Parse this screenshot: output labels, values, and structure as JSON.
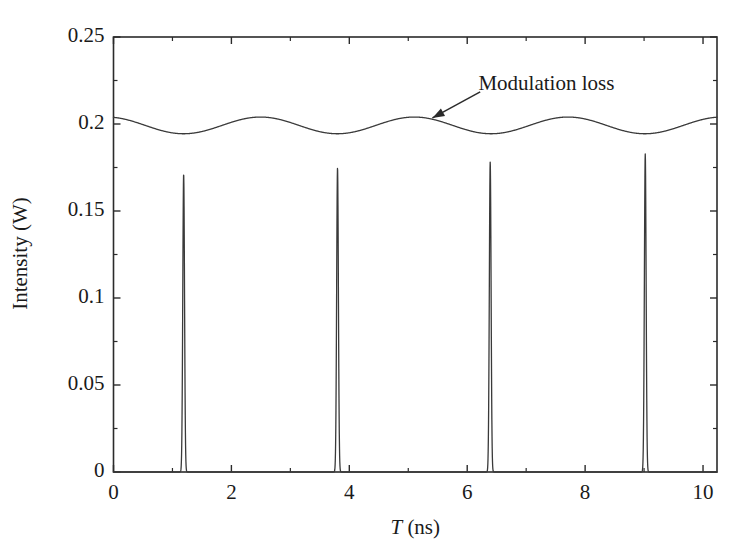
{
  "chart_data": {
    "type": "line",
    "title": "",
    "xlabel": "T (ns)",
    "xlabel_italic_part": "T",
    "xlabel_rest": " (ns)",
    "ylabel": "Intensity (W)",
    "xlim": [
      0,
      10.237
    ],
    "ylim": [
      0,
      0.25
    ],
    "grid": false,
    "legend": "none",
    "xticks": [
      0,
      2,
      4,
      6,
      8,
      10
    ],
    "xtick_labels": [
      "0",
      "2",
      "4",
      "6",
      "8",
      "10"
    ],
    "xminor_ticks": [
      1,
      3,
      5,
      7,
      9
    ],
    "yticks": [
      0,
      0.05,
      0.1,
      0.15,
      0.2,
      0.25
    ],
    "ytick_labels": [
      "0",
      "0.05",
      "0.1",
      "0.15",
      "0.2",
      "0.25"
    ],
    "yminor_ticks": [
      0.025,
      0.075,
      0.125,
      0.175,
      0.225
    ],
    "annotations": [
      {
        "text": "Modulation loss",
        "text_x": 6.19,
        "text_y": 0.2215,
        "arrow_from_x": 6.22,
        "arrow_from_y": 0.2185,
        "arrow_to_x": 5.41,
        "arrow_to_y": 0.2035
      }
    ],
    "series": [
      {
        "name": "Modulation loss",
        "kind": "sinusoid",
        "color": "#3a3a3a",
        "mean": 0.1992,
        "amplitude": 0.0048,
        "period_ns": 2.608,
        "min_positions_ns": [
          1.19,
          3.8,
          6.39,
          9.02
        ],
        "comment": "slow sinusoidal modulation-loss envelope near 0.2 W"
      },
      {
        "name": "Pulse train intensity",
        "kind": "pulses",
        "color": "#3a3a3a",
        "baseline": 0.0,
        "pulse_fwhm_ns": 0.035,
        "pulses": [
          {
            "center_ns": 1.19,
            "peak_w": 0.1713
          },
          {
            "center_ns": 3.8,
            "peak_w": 0.1748
          },
          {
            "center_ns": 6.39,
            "peak_w": 0.1782
          },
          {
            "center_ns": 9.02,
            "peak_w": 0.1828
          }
        ]
      }
    ]
  },
  "axes": {
    "frame_color": "#2b2b2b",
    "line_color": "#3a3a3a",
    "background": "#ffffff"
  }
}
